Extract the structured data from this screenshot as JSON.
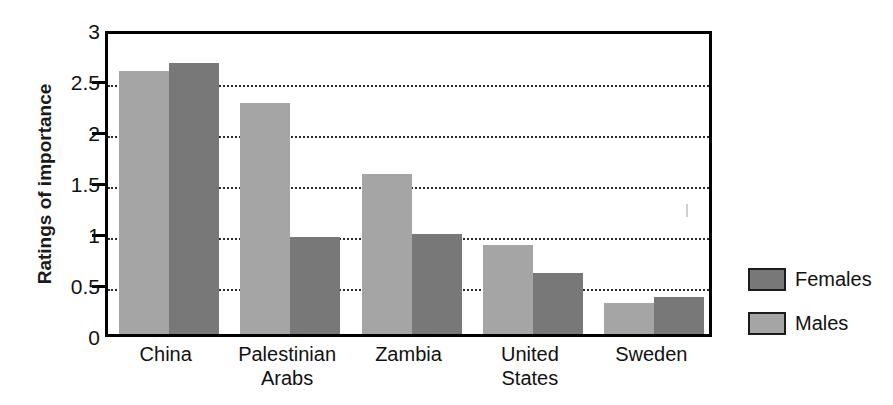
{
  "chart_data": {
    "type": "bar",
    "title": "",
    "xlabel": "",
    "ylabel": "Ratings of importance",
    "ylim": [
      0,
      3
    ],
    "ytick_values": [
      0,
      0.5,
      1,
      1.5,
      2,
      2.5,
      3
    ],
    "ytick_labels": [
      "0",
      "0.5",
      "1",
      "1.5",
      "2",
      "2.5",
      "3"
    ],
    "grid": true,
    "grid_axis": "y",
    "grid_style": "dotted",
    "legend_position": "right",
    "categories": [
      "China",
      "Palestinian Arabs",
      "Zambia",
      "United States",
      "Sweden"
    ],
    "category_label_lines": [
      [
        "China"
      ],
      [
        "Palestinian",
        "Arabs"
      ],
      [
        "Zambia"
      ],
      [
        "United",
        "States"
      ],
      [
        "Sweden"
      ]
    ],
    "series": [
      {
        "name": "Males",
        "color": "#a5a5a5",
        "values": [
          2.58,
          2.26,
          1.57,
          0.87,
          0.3
        ]
      },
      {
        "name": "Females",
        "color": "#787878",
        "values": [
          2.66,
          0.95,
          0.98,
          0.6,
          0.36
        ]
      }
    ],
    "series_draw_order": [
      "Males",
      "Females"
    ]
  },
  "legend": {
    "entries": [
      {
        "label": "Females",
        "swatch": "females"
      },
      {
        "label": "Males",
        "swatch": "males"
      }
    ]
  },
  "colors": {
    "males": "#a5a5a5",
    "females": "#787878",
    "axis": "#000000",
    "grid": "#2b2b2b",
    "text": "#111111",
    "background": "#ffffff"
  }
}
